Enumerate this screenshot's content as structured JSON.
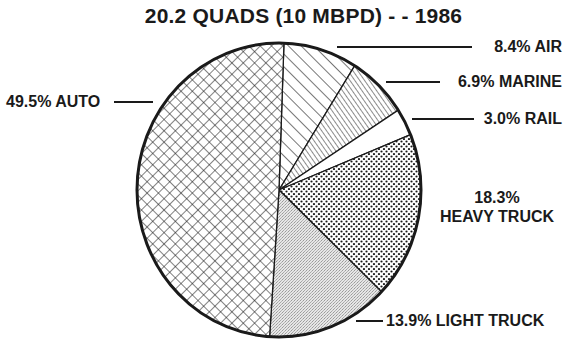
{
  "chart_data": {
    "type": "pie",
    "title": "20.2 QUADS (10 MBPD) - - 1986",
    "start_angle_deg": 2,
    "direction": "clockwise",
    "slices": [
      {
        "label": "AIR",
        "value": 8.4,
        "display": "8.4% AIR",
        "pattern": "diag-wide"
      },
      {
        "label": "MARINE",
        "value": 6.9,
        "display": "6.9% MARINE",
        "pattern": "diag-dense"
      },
      {
        "label": "RAIL",
        "value": 3.0,
        "display": "3.0% RAIL",
        "pattern": "blank"
      },
      {
        "label": "HEAVY TRUCK",
        "value": 18.3,
        "display_pct": "18.3%",
        "display_name": "HEAVY TRUCK",
        "pattern": "dots"
      },
      {
        "label": "LIGHT TRUCK",
        "value": 13.9,
        "display": "13.9% LIGHT TRUCK",
        "pattern": "stipple"
      },
      {
        "label": "AUTO",
        "value": 49.5,
        "display": "49.5% AUTO",
        "pattern": "crosshatch"
      }
    ],
    "unit": "%",
    "legend": "none (direct labels with leader lines)"
  },
  "colors": {
    "ink": "#1a1a1a",
    "background": "#ffffff",
    "stipple": "#cfcfcf"
  }
}
